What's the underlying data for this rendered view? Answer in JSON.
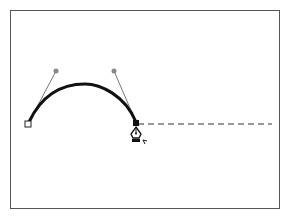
{
  "diagram": {
    "colors": {
      "frame": "#555555",
      "curve": "#111111",
      "handle_line": "#777777",
      "handle_point": "#888888",
      "dashed_preview": "#777777"
    },
    "points": {
      "start_anchor": {
        "x": 28,
        "y": 124,
        "style": "hollow-square"
      },
      "handle_1": {
        "x": 56,
        "y": 71
      },
      "handle_2": {
        "x": 114,
        "y": 71
      },
      "end_anchor": {
        "x": 136,
        "y": 124,
        "style": "filled-square"
      },
      "preview_end": {
        "x": 272,
        "y": 124
      }
    },
    "cursor": {
      "icon": "pen-tool-cursor",
      "x": 136,
      "y": 136
    }
  }
}
